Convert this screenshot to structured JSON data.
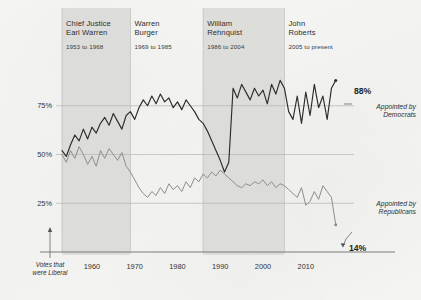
{
  "figure": {
    "y_axis_note": "Votes that\nwere Liberal"
  },
  "eras": [
    {
      "name": "era-warren",
      "title": "Chief Justice\nEarl Warren",
      "years": "1953 to 1968",
      "x0": 1953,
      "x1": 1969,
      "shaded": true
    },
    {
      "name": "era-burger",
      "title": "Warren\nBurger",
      "years": "1969 to 1985",
      "x0": 1969,
      "x1": 1986,
      "shaded": false
    },
    {
      "name": "era-rehnquist",
      "title": "William\nRehnquist",
      "years": "1986 to 2004",
      "x0": 1986,
      "x1": 2005,
      "shaded": true
    },
    {
      "name": "era-roberts",
      "title": "John\nRoberts",
      "years": "2005 to present",
      "x0": 2005,
      "x1": 2018,
      "shaded": false
    }
  ],
  "annotations": {
    "dem_value": "88%",
    "dem_label": "Appointed by\nDemocrats",
    "rep_value": "14%",
    "rep_label": "Appointed by\nRepublicans"
  },
  "colors": {
    "democrat_line": "#2b2b2b",
    "republican_line": "#8d8d8d",
    "band_shade": "#d8d8d6",
    "grid": "#b4b4b2",
    "axis": "#6e6e6e"
  },
  "chart_data": {
    "type": "line",
    "title": "",
    "subtitle": "",
    "xlabel": "",
    "ylabel": "Votes that were Liberal",
    "xlim": [
      1953,
      2018
    ],
    "ylim": [
      0,
      100
    ],
    "xticks": [
      1960,
      1970,
      1980,
      1990,
      2000,
      2010
    ],
    "xticklabels": [
      "1960",
      "1970",
      "1980",
      "1990",
      "2000",
      "2010"
    ],
    "yticks": [
      25,
      50,
      75
    ],
    "yticklabels": [
      "25%",
      "50%",
      "75%"
    ],
    "grid": "horizontal-and-era-dividers",
    "legend": "inline-right-annotations",
    "x": [
      1953,
      1954,
      1955,
      1956,
      1957,
      1958,
      1959,
      1960,
      1961,
      1962,
      1963,
      1964,
      1965,
      1966,
      1967,
      1968,
      1969,
      1970,
      1971,
      1972,
      1973,
      1974,
      1975,
      1976,
      1977,
      1978,
      1979,
      1980,
      1981,
      1982,
      1983,
      1984,
      1985,
      1986,
      1987,
      1988,
      1989,
      1990,
      1991,
      1992,
      1993,
      1994,
      1995,
      1996,
      1997,
      1998,
      1999,
      2000,
      2001,
      2002,
      2003,
      2004,
      2005,
      2006,
      2007,
      2008,
      2009,
      2010,
      2011,
      2012,
      2013,
      2014,
      2015,
      2016,
      2017
    ],
    "series": [
      {
        "name": "Appointed by Democrats",
        "color": "#2b2b2b",
        "end_value": 88,
        "values": [
          52,
          49,
          55,
          60,
          57,
          63,
          58,
          64,
          61,
          66,
          69,
          65,
          71,
          67,
          63,
          70,
          72,
          68,
          74,
          78,
          75,
          80,
          76,
          81,
          77,
          79,
          74,
          77,
          73,
          78,
          75,
          72,
          68,
          66,
          62,
          57,
          52,
          47,
          41,
          46,
          84,
          79,
          86,
          82,
          78,
          84,
          80,
          83,
          76,
          86,
          81,
          88,
          84,
          72,
          68,
          80,
          66,
          82,
          70,
          86,
          74,
          80,
          68,
          84,
          88
        ]
      },
      {
        "name": "Appointed by Republicans",
        "color": "#8d8d8d",
        "end_value": 14,
        "values": [
          50,
          46,
          52,
          48,
          54,
          50,
          45,
          49,
          44,
          52,
          48,
          53,
          50,
          47,
          51,
          44,
          41,
          37,
          33,
          30,
          28,
          31,
          29,
          33,
          30,
          35,
          32,
          34,
          31,
          36,
          33,
          38,
          36,
          40,
          38,
          41,
          39,
          42,
          40,
          38,
          36,
          34,
          33,
          35,
          34,
          36,
          35,
          37,
          34,
          36,
          33,
          35,
          34,
          32,
          30,
          28,
          33,
          24,
          26,
          31,
          27,
          34,
          31,
          28,
          14
        ]
      }
    ]
  }
}
